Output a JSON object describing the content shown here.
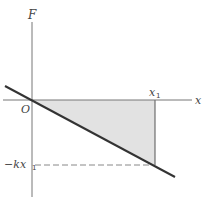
{
  "figure": {
    "axes": {
      "y_label": "F",
      "x_label": "x",
      "origin_label": "O"
    },
    "markers": {
      "x1_label": "x",
      "x1_subscript": "1",
      "neg_kx1_prefix": "−kx",
      "neg_kx1_subscript": "1"
    },
    "colors": {
      "axis": "#777777",
      "line": "#333333",
      "shade": "#e2e2e2",
      "dashed": "#888888"
    }
  }
}
